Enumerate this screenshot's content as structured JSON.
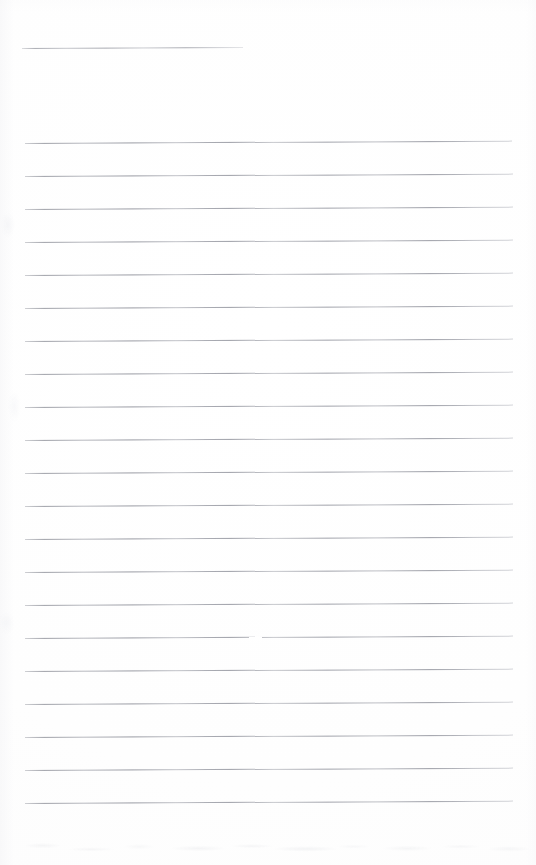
{
  "document": {
    "kind": "scanned-page",
    "title": "Blank ruled notebook page",
    "description": "A scanned sheet of lined writing paper with no handwriting or printed text. One short rule near the top, then a block of full-width horizontal ruled lines.",
    "page_width": 536,
    "page_height": 865,
    "background_color": "#ffffff",
    "rule_color": "#9a9ca4",
    "text_content": "",
    "visible_text_lines": []
  },
  "layout": {
    "left_margin_x": 25,
    "right_margin_x": 513,
    "first_rule_y": 48,
    "body_first_rule_y": 143,
    "body_last_rule_y": 803,
    "rule_spacing": 33.0,
    "rule_thickness": 1,
    "page_tilt_degrees": -0.28
  },
  "rules": {
    "header_rule": {
      "label": "short-top-rule",
      "x_start": 22,
      "x_end": 243,
      "y": 48,
      "length": 221,
      "full_width": false
    },
    "body_rule_count": 21,
    "body_rules": [
      {
        "index": 1,
        "y": 143,
        "x_start": 25,
        "x_end": 512,
        "full_width": true
      },
      {
        "index": 2,
        "y": 176,
        "x_start": 25,
        "x_end": 513,
        "full_width": true
      },
      {
        "index": 3,
        "y": 209,
        "x_start": 25,
        "x_end": 513,
        "full_width": true
      },
      {
        "index": 4,
        "y": 242,
        "x_start": 25,
        "x_end": 513,
        "full_width": true
      },
      {
        "index": 5,
        "y": 275,
        "x_start": 25,
        "x_end": 513,
        "full_width": true
      },
      {
        "index": 6,
        "y": 308,
        "x_start": 25,
        "x_end": 513,
        "full_width": true
      },
      {
        "index": 7,
        "y": 341,
        "x_start": 25,
        "x_end": 513,
        "full_width": true
      },
      {
        "index": 8,
        "y": 374,
        "x_start": 25,
        "x_end": 513,
        "full_width": true
      },
      {
        "index": 9,
        "y": 407,
        "x_start": 25,
        "x_end": 513,
        "full_width": true
      },
      {
        "index": 10,
        "y": 440,
        "x_start": 25,
        "x_end": 513,
        "full_width": true
      },
      {
        "index": 11,
        "y": 473,
        "x_start": 25,
        "x_end": 513,
        "full_width": true
      },
      {
        "index": 12,
        "y": 506,
        "x_start": 25,
        "x_end": 513,
        "full_width": true
      },
      {
        "index": 13,
        "y": 539,
        "x_start": 25,
        "x_end": 513,
        "full_width": true
      },
      {
        "index": 14,
        "y": 572,
        "x_start": 25,
        "x_end": 513,
        "full_width": true
      },
      {
        "index": 15,
        "y": 605,
        "x_start": 25,
        "x_end": 513,
        "full_width": true
      },
      {
        "index": 16,
        "y": 638,
        "x_start": 25,
        "x_end": 513,
        "full_width": true,
        "note": "faint break in stroke near x=250-262"
      },
      {
        "index": 17,
        "y": 671,
        "x_start": 25,
        "x_end": 513,
        "full_width": true
      },
      {
        "index": 18,
        "y": 704,
        "x_start": 25,
        "x_end": 513,
        "full_width": true
      },
      {
        "index": 19,
        "y": 737,
        "x_start": 25,
        "x_end": 513,
        "full_width": true
      },
      {
        "index": 20,
        "y": 770,
        "x_start": 25,
        "x_end": 513,
        "full_width": true
      },
      {
        "index": 21,
        "y": 803,
        "x_start": 25,
        "x_end": 513,
        "full_width": true
      }
    ],
    "blemish": {
      "label": "rule-stroke-gap",
      "x": 249,
      "y": 638,
      "width": 13
    }
  },
  "artifacts": {
    "bottom_noise_band_y": 835,
    "bottom_noise_band_height": 30,
    "left_edge_smudge_width": 26,
    "vignette": true
  }
}
